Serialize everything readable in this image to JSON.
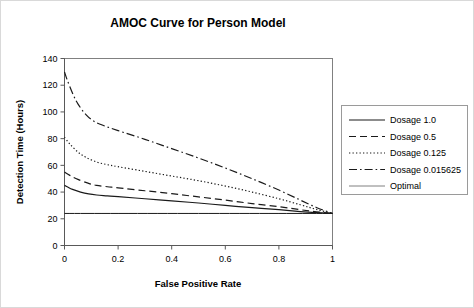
{
  "figure": {
    "title": "AMOC Curve for Person Model",
    "border_color": "#d9d9d9",
    "background": "#ffffff"
  },
  "axes": {
    "x": {
      "label": "False Positive Rate",
      "ticks": [
        "0",
        "0.2",
        "0.4",
        "0.6",
        "0.8",
        "1"
      ],
      "tick_values": [
        0,
        0.2,
        0.4,
        0.6,
        0.8,
        1
      ],
      "min": 0,
      "max": 1
    },
    "y": {
      "label": "Detection Time (Hours)",
      "ticks": [
        "0",
        "20",
        "40",
        "60",
        "80",
        "100",
        "120",
        "140"
      ],
      "tick_values": [
        0,
        20,
        40,
        60,
        80,
        100,
        120,
        140
      ],
      "min": 0,
      "max": 140
    }
  },
  "legend": {
    "position": "right",
    "items": [
      {
        "label": "Dosage 1.0",
        "style": "solid",
        "color": "#1a1a1a"
      },
      {
        "label": "Dosage 0.5",
        "style": "dashed",
        "color": "#1a1a1a"
      },
      {
        "label": "Dosage 0.125",
        "style": "dotted",
        "color": "#1a1a1a"
      },
      {
        "label": "Dosage 0.015625",
        "style": "dashdot",
        "color": "#1a1a1a"
      },
      {
        "label": "Optimal",
        "style": "solid-thin",
        "color": "#808080"
      }
    ]
  },
  "chart_data": {
    "type": "line",
    "title": "AMOC Curve for Person Model",
    "xlabel": "False Positive Rate",
    "ylabel": "Detection Time (Hours)",
    "xlim": [
      0,
      1
    ],
    "ylim": [
      0,
      140
    ],
    "xticks": [
      0,
      0.2,
      0.4,
      0.6,
      0.8,
      1
    ],
    "yticks": [
      0,
      20,
      40,
      60,
      80,
      100,
      120,
      140
    ],
    "grid": false,
    "legend_position": "right",
    "series": [
      {
        "name": "Dosage 1.0",
        "style": "solid",
        "color": "#1a1a1a",
        "points": [
          [
            0.0,
            45.0
          ],
          [
            0.01,
            44.0
          ],
          [
            0.03,
            42.0
          ],
          [
            0.06,
            40.0
          ],
          [
            0.09,
            38.6
          ],
          [
            0.12,
            37.8
          ],
          [
            0.16,
            37.2
          ],
          [
            0.2,
            36.6
          ],
          [
            0.3,
            35.0
          ],
          [
            0.4,
            33.4
          ],
          [
            0.5,
            31.8
          ],
          [
            0.6,
            30.0
          ],
          [
            0.7,
            28.3
          ],
          [
            0.8,
            26.8
          ],
          [
            0.88,
            25.4
          ],
          [
            0.94,
            24.6
          ],
          [
            1.0,
            24.0
          ]
        ]
      },
      {
        "name": "Dosage 0.5",
        "style": "dashed",
        "color": "#1a1a1a",
        "points": [
          [
            0.0,
            55.0
          ],
          [
            0.02,
            52.5
          ],
          [
            0.05,
            49.5
          ],
          [
            0.09,
            46.5
          ],
          [
            0.12,
            45.0
          ],
          [
            0.16,
            44.0
          ],
          [
            0.2,
            43.2
          ],
          [
            0.3,
            41.0
          ],
          [
            0.4,
            38.8
          ],
          [
            0.5,
            36.4
          ],
          [
            0.6,
            34.0
          ],
          [
            0.7,
            31.4
          ],
          [
            0.8,
            29.0
          ],
          [
            0.88,
            26.8
          ],
          [
            0.94,
            25.2
          ],
          [
            1.0,
            24.0
          ]
        ]
      },
      {
        "name": "Dosage 0.125",
        "style": "dotted",
        "color": "#1a1a1a",
        "points": [
          [
            0.0,
            81.0
          ],
          [
            0.02,
            76.0
          ],
          [
            0.05,
            70.0
          ],
          [
            0.08,
            66.0
          ],
          [
            0.12,
            62.5
          ],
          [
            0.16,
            60.5
          ],
          [
            0.2,
            59.0
          ],
          [
            0.3,
            55.5
          ],
          [
            0.4,
            52.0
          ],
          [
            0.5,
            48.5
          ],
          [
            0.6,
            44.5
          ],
          [
            0.7,
            40.0
          ],
          [
            0.8,
            35.0
          ],
          [
            0.88,
            30.5
          ],
          [
            0.94,
            27.0
          ],
          [
            1.0,
            24.0
          ]
        ]
      },
      {
        "name": "Dosage 0.015625",
        "style": "dashdot",
        "color": "#1a1a1a",
        "points": [
          [
            0.0,
            130.0
          ],
          [
            0.01,
            124.0
          ],
          [
            0.03,
            114.0
          ],
          [
            0.05,
            106.0
          ],
          [
            0.08,
            98.0
          ],
          [
            0.11,
            93.0
          ],
          [
            0.15,
            89.5
          ],
          [
            0.2,
            86.0
          ],
          [
            0.3,
            79.5
          ],
          [
            0.4,
            72.5
          ],
          [
            0.5,
            65.5
          ],
          [
            0.6,
            58.0
          ],
          [
            0.7,
            50.0
          ],
          [
            0.8,
            41.5
          ],
          [
            0.88,
            34.0
          ],
          [
            0.94,
            28.5
          ],
          [
            1.0,
            24.0
          ]
        ]
      },
      {
        "name": "Optimal",
        "style": "solid-thin",
        "color": "#808080",
        "points": [
          [
            0.0,
            24.0
          ],
          [
            1.0,
            24.0
          ]
        ]
      }
    ]
  }
}
